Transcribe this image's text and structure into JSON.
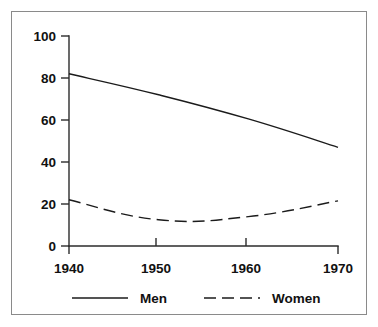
{
  "chart_data": {
    "type": "line",
    "title": "",
    "subtitle": "",
    "xlabel": "",
    "ylabel": "",
    "x": [
      1940,
      1950,
      1960,
      1970
    ],
    "categories": [
      "1940",
      "1950",
      "1960",
      "1970"
    ],
    "xlim": [
      1940,
      1970
    ],
    "ylim": [
      0,
      100
    ],
    "y_ticks": [
      0,
      20,
      40,
      60,
      80,
      100
    ],
    "y_tick_labels": [
      "0",
      "20",
      "40",
      "60",
      "80",
      "100"
    ],
    "x_tick_labels": [
      "1940",
      "1950",
      "1960",
      "1970"
    ],
    "grid": false,
    "legend_position": "bottom",
    "series": [
      {
        "name": "Men",
        "style": "solid",
        "color": "#1b1b1b",
        "values": [
          82,
          72,
          60.5,
          47
        ]
      },
      {
        "name": "Women",
        "style": "dashed",
        "color": "#1b1b1b",
        "values": [
          22,
          12.5,
          14,
          21.5
        ]
      }
    ],
    "annotations": []
  },
  "axes": {
    "y_labels": [
      "100",
      "80",
      "60",
      "40",
      "20",
      "0"
    ],
    "x_labels": [
      "1940",
      "1950",
      "1960",
      "1970"
    ]
  },
  "legend": {
    "items": [
      {
        "label": "Men",
        "style": "solid"
      },
      {
        "label": "Women",
        "style": "dashed"
      }
    ]
  },
  "colors": {
    "frame": "#8a8a8a",
    "axis": "#2b2b2b",
    "series": "#1b1b1b",
    "text": "#111111",
    "background": "#ffffff"
  }
}
